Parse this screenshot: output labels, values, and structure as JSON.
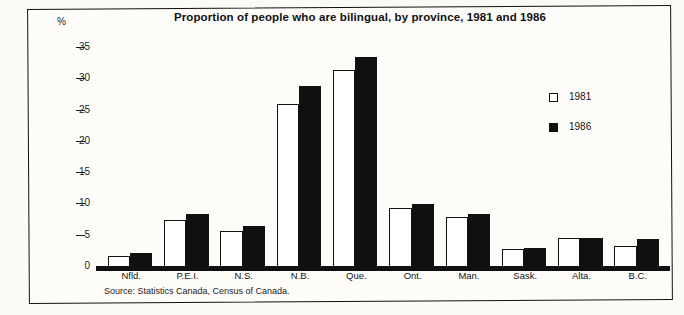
{
  "figure": {
    "unit_label": "%",
    "source_note": "Source: Statistics Canada, Census of Canada."
  },
  "legend": {
    "position": "right-middle",
    "items": [
      {
        "label": "1981",
        "swatch": "open-square",
        "color": "#ffffff"
      },
      {
        "label": "1986",
        "swatch": "filled-square",
        "color": "#101010"
      }
    ]
  },
  "chart_data": {
    "type": "bar",
    "title": "Proportion of people who are bilingual, by province, 1981 and 1986",
    "xlabel": "",
    "ylabel": "%",
    "categories": [
      "Nfld.",
      "P.E.I.",
      "N.S.",
      "N.B.",
      "Que.",
      "Ont.",
      "Man.",
      "Sask.",
      "Alta.",
      "B.C."
    ],
    "series": [
      {
        "name": "1981",
        "values": [
          1.7,
          7.5,
          5.8,
          26.0,
          31.5,
          9.5,
          8.0,
          2.9,
          4.6,
          3.3
        ]
      },
      {
        "name": "1986",
        "values": [
          2.3,
          8.5,
          6.6,
          29.0,
          33.5,
          10.0,
          8.5,
          3.0,
          4.6,
          4.4
        ]
      }
    ],
    "ylim": [
      0,
      35
    ],
    "yticks": [
      "0",
      "5",
      "10",
      "15",
      "20",
      "25",
      "30",
      "35"
    ],
    "grid": false
  }
}
